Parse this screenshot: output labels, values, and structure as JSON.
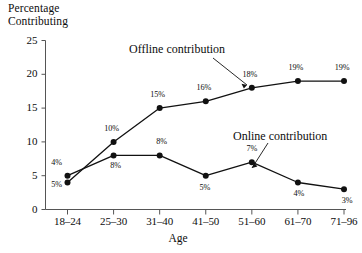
{
  "chart_data": {
    "type": "line",
    "title": "",
    "xlabel": "Age",
    "ylabel": "Percentage\nContributing",
    "categories": [
      "18–24",
      "25–30",
      "31–40",
      "41–50",
      "51–60",
      "61–70",
      "71–96"
    ],
    "ylim": [
      0,
      25
    ],
    "yticks": [
      0,
      5,
      10,
      15,
      20,
      25
    ],
    "ytick_labels": [
      "0",
      "5",
      "10",
      "15",
      "20",
      "25"
    ],
    "grid": false,
    "legend": "annotations",
    "series": [
      {
        "name": "Offline contribution",
        "values": [
          4,
          10,
          15,
          16,
          18,
          19,
          19
        ],
        "labels": [
          "4%",
          "10%",
          "15%",
          "16%",
          "18%",
          "19%",
          "19%"
        ],
        "color": "#111111"
      },
      {
        "name": "Online contribution",
        "values": [
          5,
          8,
          8,
          5,
          7,
          4,
          3
        ],
        "labels": [
          "5%",
          "8%",
          "8%",
          "5%",
          "7%",
          "4%",
          "3%"
        ],
        "color": "#111111"
      }
    ],
    "annotations": [
      {
        "text": "Offline contribution",
        "target": "18% point"
      },
      {
        "text": "Online contribution",
        "target": "between 7% and 4% points"
      }
    ]
  }
}
